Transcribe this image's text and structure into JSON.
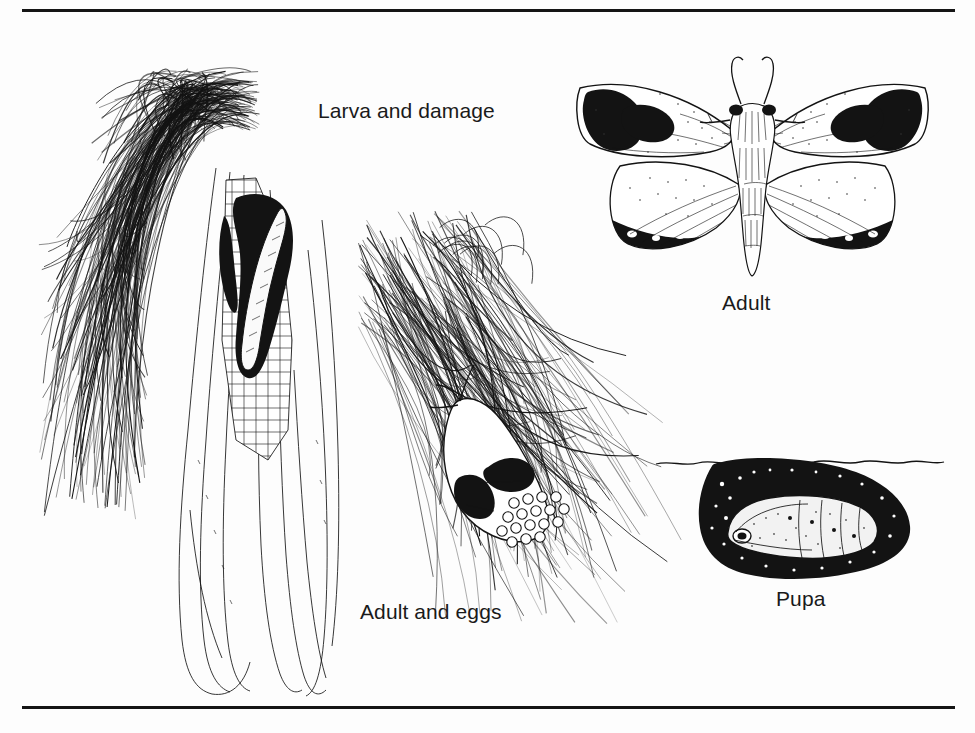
{
  "figure": {
    "background_color": "#fdfdfd",
    "ink_color": "#131313",
    "rules": {
      "top": "horizontal-rule-top",
      "bottom": "horizontal-rule-bottom"
    }
  },
  "captions": {
    "larva": "Larva and damage",
    "adult": "Adult",
    "eggs": "Adult and eggs",
    "pupa": "Pupa"
  },
  "illustrations": {
    "corn": {
      "name": "corn-ear-with-larva-damage",
      "description": "Ear of corn with drooping silks, husk peeled back exposing kernels, dark feeding damage and larva at the tip"
    },
    "eggs": {
      "name": "adult-moth-on-silk-with-eggs",
      "description": "Adult moth resting on corn silk with a cluster of round white eggs"
    },
    "moth": {
      "name": "adult-moth-spread-wings",
      "description": "Adult moth with wings spread, dark blotches at forewing tips and dark bands on hindwing margins, lyre-shaped antennae"
    },
    "pupa": {
      "name": "pupa-in-soil-cell",
      "description": "Pupa inside an earthen cell below a wavy soil-surface line"
    }
  }
}
